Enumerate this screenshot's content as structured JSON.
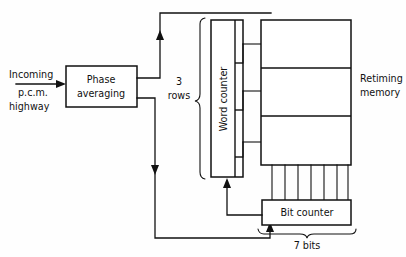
{
  "diagram": {
    "background_color": "#fefefe",
    "line_color": "#111111",
    "blocks": [
      {
        "id": "phase-averaging",
        "label_line1": "Phase",
        "label_line2": "averaging"
      },
      {
        "id": "word-counter",
        "label": "Word counter"
      },
      {
        "id": "retiming-memory",
        "label_line1": "Retiming",
        "label_line2": "memory",
        "rows": 3
      },
      {
        "id": "bit-counter",
        "label": "Bit counter"
      }
    ],
    "labels": {
      "incoming_line1": "Incoming",
      "incoming_line2": "p.c.m.",
      "incoming_line3": "highway",
      "rows_count": "3",
      "rows_word": "rows",
      "bits": "7 bits",
      "retiming_line1": "Retiming",
      "retiming_line2": "memory",
      "word_counter": "Word counter",
      "bit_counter": "Bit counter",
      "phase_line1": "Phase",
      "phase_line2": "averaging"
    },
    "bus": {
      "bit_lines": 7,
      "bit_label": "7 bits",
      "row_lines": 3,
      "row_label": "3 rows"
    }
  }
}
